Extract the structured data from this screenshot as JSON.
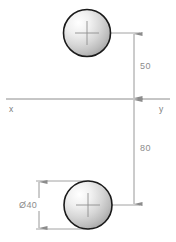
{
  "drawing": {
    "title": "Two circles dimensioned from x-y axis",
    "background_color": "#ffffff",
    "line_color": "#8c8c8c",
    "circle_outline_color": "#1a1a1a",
    "text_color": "#8c8c8c",
    "axis": {
      "left_label": "x",
      "right_label": "y",
      "y_position": 99
    },
    "dimensions": [
      {
        "name": "upper-offset",
        "value": "50",
        "from": "upper circle center",
        "to": "x-y axis"
      },
      {
        "name": "lower-offset",
        "value": "80",
        "from": "x-y axis",
        "to": "lower circle center"
      },
      {
        "name": "diameter",
        "value": "Ø40",
        "applies_to": "lower circle"
      }
    ],
    "circles": [
      {
        "name": "upper-circle",
        "cx": 87,
        "cy": 33,
        "r": 23.5,
        "center_mark": true
      },
      {
        "name": "lower-circle",
        "cx": 88,
        "cy": 205,
        "r": 24,
        "center_mark": true
      }
    ]
  }
}
